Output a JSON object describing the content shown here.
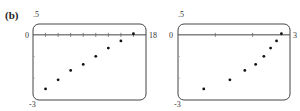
{
  "figure": {
    "panel_label": "(b)"
  },
  "plots": [
    {
      "ymax_label": ".5",
      "zero_label": "0",
      "xmax_label": "18",
      "ymin_label": "-3"
    },
    {
      "ymax_label": ".5",
      "zero_label": "0",
      "xmax_label": "3",
      "ymin_label": "-3"
    }
  ],
  "chart_data": [
    {
      "type": "scatter",
      "title": "",
      "xlabel": "",
      "ylabel": "",
      "xlim": [
        0,
        18
      ],
      "ylim": [
        -3,
        0.5
      ],
      "x_ticks": [
        2,
        4,
        6,
        8,
        10,
        12,
        14,
        16
      ],
      "y_ticks": [
        -1,
        -2
      ],
      "grid": false,
      "x": [
        2,
        4,
        6,
        8,
        10,
        12,
        14,
        16
      ],
      "y": [
        -2.49,
        -2.07,
        -1.64,
        -1.36,
        -0.99,
        -0.61,
        -0.28,
        0.05
      ]
    },
    {
      "type": "scatter",
      "title": "",
      "xlabel": "",
      "ylabel": "",
      "xlim": [
        0,
        3
      ],
      "ylim": [
        -3,
        0.5
      ],
      "x_ticks": [
        1,
        2
      ],
      "y_ticks": [
        -1,
        -2
      ],
      "grid": false,
      "x": [
        0.69,
        1.39,
        1.79,
        2.08,
        2.3,
        2.48,
        2.64,
        2.77
      ],
      "y": [
        -2.49,
        -2.07,
        -1.64,
        -1.36,
        -0.99,
        -0.61,
        -0.28,
        0.05
      ]
    }
  ]
}
